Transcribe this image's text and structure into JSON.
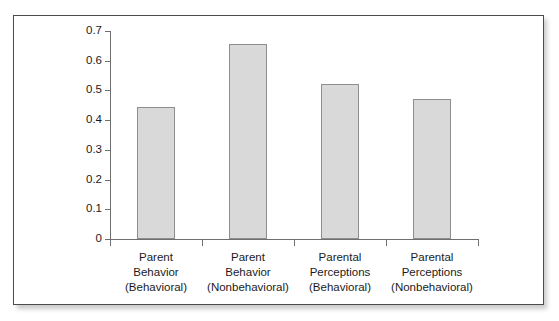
{
  "chart_data": {
    "type": "bar",
    "title": "",
    "subtitle": "",
    "xlabel": "",
    "ylabel": "",
    "ylim": [
      0,
      0.7
    ],
    "ytick_labels": [
      "0.7",
      "0.6",
      "0.5",
      "0.4",
      "0.3",
      "0.2",
      "0.1",
      "0"
    ],
    "ytick_values": [
      0.7,
      0.6,
      0.5,
      0.4,
      0.3,
      0.2,
      0.1,
      0
    ],
    "grid": false,
    "legend": false,
    "bar_fill_color": "#d9d9d9",
    "bar_border_color": "#8d8d8d",
    "axis_color": "#6f6f6f",
    "categories": [
      "Parent Behavior (Behavioral)",
      "Parent Behavior (Nonbehavioral)",
      "Parental Perceptions (Behavioral)",
      "Parental Perceptions (Nonbehavioral)"
    ],
    "category_lines": [
      [
        "Parent",
        "Behavior",
        "(Behavioral)"
      ],
      [
        "Parent",
        "Behavior",
        "(Nonbehavioral)"
      ],
      [
        "Parental",
        "Perceptions",
        "(Behavioral)"
      ],
      [
        "Parental",
        "Perceptions",
        "(Nonbehavioral)"
      ]
    ],
    "values": [
      0.445,
      0.655,
      0.52,
      0.47
    ]
  }
}
